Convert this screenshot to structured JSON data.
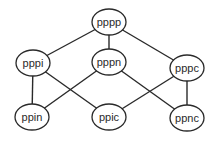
{
  "diagram": {
    "type": "lattice",
    "nodes": [
      {
        "id": "pppp",
        "label": "pppp",
        "level": 0
      },
      {
        "id": "pppi",
        "label": "pppi",
        "level": 1
      },
      {
        "id": "pppn",
        "label": "pppn",
        "level": 1
      },
      {
        "id": "pppc",
        "label": "pppc",
        "level": 1
      },
      {
        "id": "ppin",
        "label": "ppin",
        "level": 2
      },
      {
        "id": "ppic",
        "label": "ppic",
        "level": 2
      },
      {
        "id": "ppnc",
        "label": "ppnc",
        "level": 2
      }
    ],
    "edges": [
      {
        "from": "pppp",
        "to": "pppi"
      },
      {
        "from": "pppp",
        "to": "pppn"
      },
      {
        "from": "pppp",
        "to": "pppc"
      },
      {
        "from": "pppi",
        "to": "ppin"
      },
      {
        "from": "pppi",
        "to": "ppic"
      },
      {
        "from": "pppn",
        "to": "ppin"
      },
      {
        "from": "pppn",
        "to": "ppnc"
      },
      {
        "from": "pppc",
        "to": "ppic"
      },
      {
        "from": "pppc",
        "to": "ppnc"
      }
    ]
  }
}
